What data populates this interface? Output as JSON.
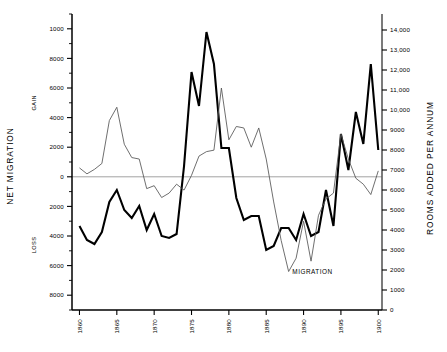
{
  "chart_data": {
    "type": "line",
    "title": "",
    "xlabel": "",
    "x_ticks": [
      "1860",
      "1865",
      "1870",
      "1875",
      "1880",
      "1885",
      "1890",
      "1895",
      "1900"
    ],
    "x_tick_values": [
      1860,
      1865,
      1870,
      1875,
      1880,
      1885,
      1890,
      1895,
      1900
    ],
    "xlim": [
      1859,
      1900.5
    ],
    "grid": false,
    "legend_position": "inline-annotation",
    "zero_line": true,
    "left_axis": {
      "label": "NET MIGRATION",
      "sublabels": [
        "GAIN",
        "LOSS"
      ],
      "ylim": [
        -9000,
        11000
      ],
      "tick_values": [
        10000,
        8000,
        6000,
        4000,
        2000,
        0,
        -2000,
        -4000,
        -6000,
        -8000
      ],
      "tick_labels": [
        "1000",
        "8000",
        "6000",
        "4000",
        "2000",
        "0",
        "2000",
        "4000",
        "6000",
        "8000"
      ],
      "minor_ticks": [
        11000,
        9000,
        7000,
        5000,
        3000,
        1000,
        -1000,
        -3000,
        -5000,
        -7000,
        -9000
      ]
    },
    "right_axis": {
      "label": "ROOMS ADDED PER ANNUM",
      "ylim": [
        0,
        14800
      ],
      "tick_values": [
        14000,
        13000,
        12000,
        11000,
        10000,
        9000,
        8000,
        7000,
        6000,
        5000,
        4000,
        3000,
        2000,
        1000,
        0
      ],
      "tick_labels": [
        "14,000",
        "13,000",
        "12,000",
        "11,000",
        "10,000",
        "9000",
        "8000",
        "7000",
        "6000",
        "5000",
        "4000",
        "3000",
        "2000",
        "1000",
        "0"
      ]
    },
    "series": [
      {
        "name": "ROOMS ADDED PER ANNUM",
        "axis": "right",
        "style": "thick",
        "color": "#000000",
        "width": 2.1,
        "annotation": "",
        "x": [
          1860,
          1861,
          1862,
          1863,
          1864,
          1865,
          1866,
          1867,
          1868,
          1869,
          1870,
          1871,
          1872,
          1873,
          1874,
          1875,
          1876,
          1877,
          1878,
          1879,
          1880,
          1881,
          1882,
          1883,
          1884,
          1885,
          1886,
          1887,
          1888,
          1889,
          1890,
          1891,
          1892,
          1893,
          1894,
          1895,
          1896,
          1897,
          1898,
          1899,
          1900
        ],
        "values": [
          4200,
          3500,
          3300,
          3900,
          5400,
          6000,
          5000,
          4600,
          5200,
          4000,
          4800,
          3700,
          3600,
          3800,
          7200,
          11900,
          10200,
          13900,
          12300,
          8100,
          8100,
          5600,
          4500,
          4700,
          4700,
          3000,
          3200,
          4100,
          4100,
          3500,
          4800,
          3700,
          3900,
          6000,
          4200,
          8800,
          7000,
          9900,
          8300,
          12300,
          8000
        ]
      },
      {
        "name": "MIGRATION",
        "axis": "left",
        "style": "thin",
        "color": "#555555",
        "width": 0.85,
        "annotation": "MIGRATION",
        "x": [
          1860,
          1861,
          1862,
          1863,
          1864,
          1865,
          1866,
          1867,
          1868,
          1869,
          1870,
          1871,
          1872,
          1873,
          1874,
          1875,
          1876,
          1877,
          1878,
          1879,
          1880,
          1881,
          1882,
          1883,
          1884,
          1885,
          1886,
          1887,
          1888,
          1889,
          1890,
          1891,
          1892,
          1893,
          1894,
          1895,
          1896,
          1897,
          1898,
          1899,
          1900
        ],
        "values": [
          600,
          200,
          500,
          900,
          3800,
          4700,
          2200,
          1300,
          1200,
          -800,
          -600,
          -1400,
          -1100,
          -500,
          -900,
          100,
          1400,
          1700,
          1800,
          6000,
          2500,
          3400,
          3300,
          2000,
          3300,
          1200,
          -1700,
          -4300,
          -6400,
          -5500,
          -3000,
          -5700,
          -2600,
          -1500,
          -1100,
          2900,
          1200,
          -100,
          -500,
          -1200,
          400
        ]
      }
    ],
    "annotations": [
      {
        "text": "MIGRATION",
        "x": 1888.5,
        "y": -6600
      }
    ]
  },
  "colors": {
    "ink": "#000000",
    "thin_line": "#555555",
    "zero_line": "#8a8a8a",
    "background": "#ffffff"
  }
}
